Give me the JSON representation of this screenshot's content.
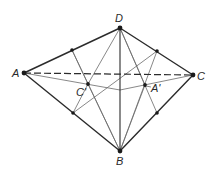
{
  "diagram": {
    "type": "tetrahedron-construction",
    "colors": {
      "edge": "#2b2b2b",
      "thin": "#6a6a6a",
      "point": "#1a1a1a",
      "label": "#2a2a2a"
    },
    "points": {
      "A": {
        "label": "A",
        "x": 24,
        "y": 73
      },
      "B": {
        "label": "B",
        "x": 120,
        "y": 151
      },
      "C": {
        "label": "C",
        "x": 193,
        "y": 75
      },
      "D": {
        "label": "D",
        "x": 120,
        "y": 28
      },
      "A_prime": {
        "label": "A'",
        "x": 145,
        "y": 85
      },
      "C_prime": {
        "label": "C'",
        "x": 88,
        "y": 84
      },
      "M_AD": {
        "x": 72,
        "y": 50
      },
      "M_AB": {
        "x": 73,
        "y": 113
      },
      "M_DC": {
        "x": 157,
        "y": 51
      },
      "M_CB": {
        "x": 157,
        "y": 113
      },
      "V": {
        "x": 120,
        "y": 90
      }
    },
    "labels": {
      "A": "A",
      "B": "B",
      "C": "C",
      "D": "D",
      "A_prime": "A'",
      "C_prime": "C'"
    },
    "edges_solid": [
      [
        "A",
        "D"
      ],
      [
        "D",
        "C"
      ],
      [
        "A",
        "B"
      ],
      [
        "B",
        "C"
      ],
      [
        "D",
        "B"
      ]
    ],
    "edges_dashed": [
      [
        "A",
        "C"
      ]
    ],
    "edges_thin": [
      [
        "D",
        "C_prime"
      ],
      [
        "C_prime",
        "B"
      ],
      [
        "D",
        "A_prime"
      ],
      [
        "A_prime",
        "B"
      ],
      [
        "M_AD",
        "M_CB"
      ],
      [
        "M_AB",
        "M_DC"
      ],
      [
        "A",
        "V"
      ],
      [
        "V",
        "C"
      ]
    ]
  }
}
